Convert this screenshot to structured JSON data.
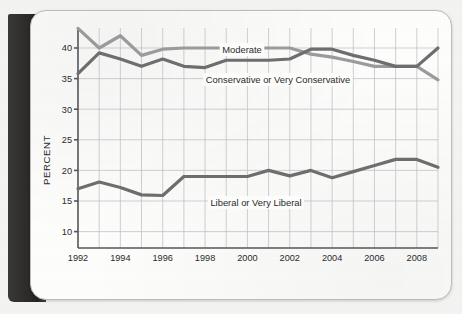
{
  "figure": {
    "axis": {
      "ylabel": "PERCENT",
      "y_ticks": [
        "10",
        "15",
        "20",
        "25",
        "30",
        "35",
        "40"
      ],
      "x_ticks": [
        "1992",
        "1994",
        "1996",
        "1998",
        "2000",
        "2002",
        "2004",
        "2006",
        "2008"
      ]
    },
    "labels": {
      "moderate": "Moderate",
      "conservative": "Conservative or Very Conservative",
      "liberal": "Liberal or Very Liberal"
    },
    "colors": {
      "moderate": "#9b9b9b",
      "conservative": "#6e6e6e",
      "liberal": "#6e6e6e",
      "grid": "#b9bcc2",
      "axis": "#55565a",
      "page": "#fdfdfc",
      "binding": "#2e2d2c"
    }
  },
  "chart_data": {
    "type": "line",
    "title": "",
    "xlabel": "",
    "ylabel": "PERCENT",
    "xlim": [
      1992,
      2009
    ],
    "ylim": [
      10,
      43.5
    ],
    "grid": true,
    "legend": "inline-annotations",
    "x": [
      1992,
      1993,
      1994,
      1995,
      1996,
      1997,
      1998,
      1999,
      2000,
      2001,
      2002,
      2003,
      2004,
      2005,
      2006,
      2007,
      2008,
      2009
    ],
    "x_tick_labels": [
      "1992",
      "1994",
      "1996",
      "1998",
      "2000",
      "2002",
      "2004",
      "2006",
      "2008"
    ],
    "y_tick_labels": [
      "10",
      "15",
      "20",
      "25",
      "30",
      "35",
      "40"
    ],
    "series": [
      {
        "name": "Moderate",
        "color": "#9b9b9b",
        "values": [
          43.2,
          40.0,
          42.0,
          38.8,
          39.8,
          40.0,
          40.0,
          40.0,
          40.0,
          40.0,
          40.0,
          39.0,
          38.5,
          37.8,
          37.0,
          37.0,
          37.0,
          34.8
        ]
      },
      {
        "name": "Conservative or Very Conservative",
        "color": "#6e6e6e",
        "values": [
          35.8,
          39.2,
          38.2,
          37.0,
          38.2,
          37.0,
          36.8,
          38.0,
          38.0,
          38.0,
          38.2,
          39.8,
          39.8,
          38.8,
          38.0,
          37.0,
          37.0,
          40.0
        ]
      },
      {
        "name": "Liberal or Very Liberal",
        "color": "#6e6e6e",
        "values": [
          17.0,
          18.1,
          17.2,
          16.0,
          15.9,
          19.0,
          19.0,
          19.0,
          19.0,
          20.0,
          19.1,
          20.0,
          18.8,
          19.8,
          20.8,
          21.8,
          21.8,
          20.5
        ]
      }
    ]
  }
}
